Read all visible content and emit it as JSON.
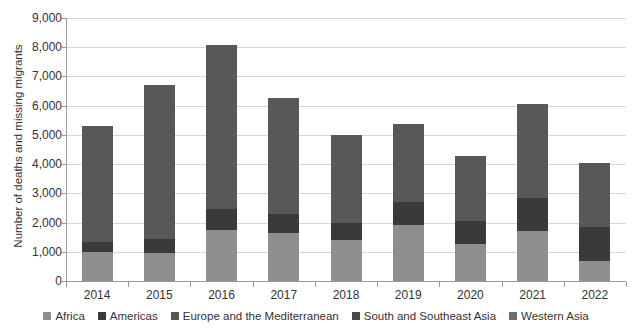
{
  "chart_data": {
    "type": "bar",
    "subtype": "stacked-bar",
    "title": "",
    "xlabel": "",
    "ylabel": "Number of deaths and missing migrants",
    "categories": [
      "2014",
      "2015",
      "2016",
      "2017",
      "2018",
      "2019",
      "2020",
      "2021",
      "2022"
    ],
    "ylim": [
      0,
      9000
    ],
    "ytick_values": [
      0,
      1000,
      2000,
      3000,
      4000,
      5000,
      6000,
      7000,
      8000,
      9000
    ],
    "ytick_labels": [
      "0",
      "1,000",
      "2,000",
      "3,000",
      "4,000",
      "5,000",
      "6,000",
      "7,000",
      "8,000",
      "9,000"
    ],
    "grid": true,
    "legend_position": "bottom",
    "series": [
      {
        "name": "Africa",
        "color": "#8e8e8e",
        "values": [
          990,
          950,
          1750,
          1650,
          1400,
          1900,
          1250,
          1700,
          700
        ]
      },
      {
        "name": "Americas",
        "color": "#3a3a3a",
        "values": [
          330,
          500,
          700,
          650,
          600,
          800,
          800,
          1150,
          1150
        ]
      },
      {
        "name": "Europe and the Mediterranean",
        "color": "#585858",
        "values": [
          3990,
          5250,
          5630,
          3980,
          2990,
          2690,
          2220,
          3200,
          2180
        ]
      },
      {
        "name": "South and Southeast Asia",
        "color": "#4a4a4a",
        "values": [
          0,
          0,
          0,
          0,
          0,
          0,
          0,
          0,
          0
        ]
      },
      {
        "name": "Western Asia",
        "color": "#6e6e6e",
        "values": [
          0,
          0,
          0,
          0,
          0,
          0,
          0,
          0,
          0
        ]
      }
    ],
    "totals": [
      5310,
      6700,
      8080,
      6280,
      4990,
      5390,
      4270,
      6050,
      4030
    ]
  },
  "axes": {
    "y_title": "Number of deaths and missing migrants"
  },
  "legend": {
    "items": [
      {
        "label": "Africa",
        "color": "#8e8e8e"
      },
      {
        "label": "Americas",
        "color": "#3a3a3a"
      },
      {
        "label": "Europe and the Mediterranean",
        "color": "#585858"
      },
      {
        "label": "South and Southeast Asia",
        "color": "#4a4a4a"
      },
      {
        "label": "Western Asia",
        "color": "#6e6e6e"
      }
    ]
  },
  "colors": {
    "gridline": "#d6d6d6",
    "axis": "#9a9a9a",
    "text": "#333333",
    "background": "#ffffff"
  }
}
